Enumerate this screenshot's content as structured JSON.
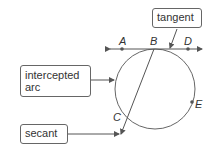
{
  "labels": {
    "tangent": "tangent",
    "intercepted_arc_line1": "intercepted",
    "intercepted_arc_line2": "arc",
    "secant": "secant"
  },
  "points": {
    "A": "A",
    "B": "B",
    "C": "C",
    "D": "D",
    "E": "E"
  },
  "colors": {
    "stroke": "#555555",
    "box_border": "#666666",
    "text": "#333333"
  }
}
